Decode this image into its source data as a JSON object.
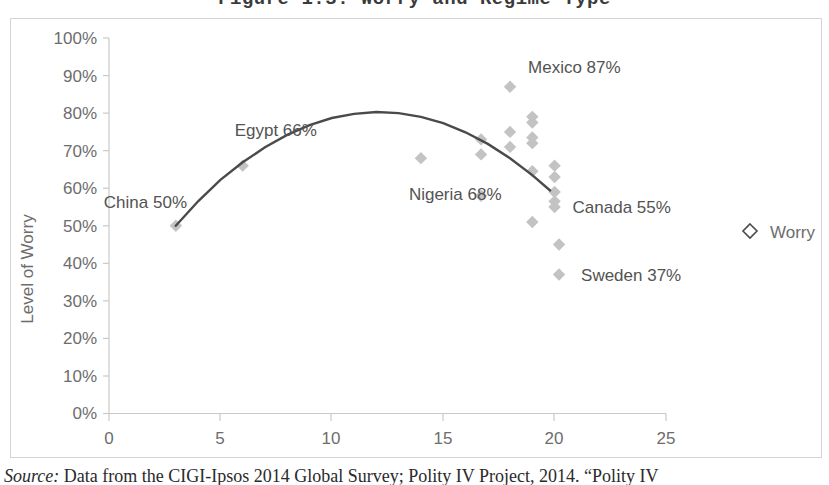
{
  "figure": {
    "title": "Figure 1.3: Worry and Regime Type",
    "source_label": "Source:",
    "source_text": " Data from the CIGI-Ipsos 2014 Global Survey; Polity IV Project, 2014. “Polity IV"
  },
  "colors": {
    "marker": "#c3c3c3",
    "trend_line": "#4a4a4a",
    "axis": "#c9c9c9",
    "tick_text": "#6d6d6d",
    "label_text": "#535353",
    "frame_border": "#d5d5d5",
    "background": "#ffffff"
  },
  "legend": {
    "position": "right",
    "entries": [
      {
        "label": "Worry",
        "marker": "open-diamond"
      }
    ]
  },
  "chart_data": {
    "type": "scatter",
    "title": "Figure 1.3: Worry and Regime Type",
    "xlabel": "",
    "ylabel": "Level of Worry",
    "xlim": [
      0,
      25
    ],
    "ylim": [
      0,
      1.0
    ],
    "grid": false,
    "legend": [
      "Worry"
    ],
    "legend_position": "right",
    "x_ticks": [
      0,
      5,
      10,
      15,
      20,
      25
    ],
    "x_tick_labels": [
      "0",
      "5",
      "10",
      "15",
      "20",
      "25"
    ],
    "y_ticks": [
      0,
      0.1,
      0.2,
      0.3,
      0.4,
      0.5,
      0.6,
      0.7,
      0.8,
      0.9,
      1.0
    ],
    "y_tick_labels": [
      "0%",
      "10%",
      "20%",
      "30%",
      "40%",
      "50%",
      "60%",
      "70%",
      "80%",
      "90%",
      "100%"
    ],
    "series": [
      {
        "name": "Worry",
        "marker": "diamond",
        "points": [
          {
            "x": 3,
            "y": 0.5
          },
          {
            "x": 6,
            "y": 0.66
          },
          {
            "x": 14,
            "y": 0.68
          },
          {
            "x": 16.7,
            "y": 0.73
          },
          {
            "x": 16.7,
            "y": 0.69
          },
          {
            "x": 16.7,
            "y": 0.58
          },
          {
            "x": 18,
            "y": 0.87
          },
          {
            "x": 18,
            "y": 0.75
          },
          {
            "x": 18,
            "y": 0.71
          },
          {
            "x": 19,
            "y": 0.79
          },
          {
            "x": 19,
            "y": 0.775
          },
          {
            "x": 19,
            "y": 0.735
          },
          {
            "x": 19,
            "y": 0.72
          },
          {
            "x": 19,
            "y": 0.645
          },
          {
            "x": 19,
            "y": 0.51
          },
          {
            "x": 20,
            "y": 0.66
          },
          {
            "x": 20,
            "y": 0.63
          },
          {
            "x": 20,
            "y": 0.59
          },
          {
            "x": 20,
            "y": 0.565
          },
          {
            "x": 20,
            "y": 0.55
          },
          {
            "x": 20.2,
            "y": 0.45
          },
          {
            "x": 20.2,
            "y": 0.37
          }
        ]
      }
    ],
    "trend": {
      "type": "quadratic-fit",
      "description": "Inverted-U polynomial trend line peaking near x=12 at about 80%",
      "points": [
        {
          "x": 3,
          "y": 0.5
        },
        {
          "x": 4,
          "y": 0.565
        },
        {
          "x": 5,
          "y": 0.622
        },
        {
          "x": 6,
          "y": 0.669
        },
        {
          "x": 7,
          "y": 0.709
        },
        {
          "x": 8,
          "y": 0.742
        },
        {
          "x": 9,
          "y": 0.768
        },
        {
          "x": 10,
          "y": 0.787
        },
        {
          "x": 11,
          "y": 0.798
        },
        {
          "x": 12,
          "y": 0.803
        },
        {
          "x": 13,
          "y": 0.8
        },
        {
          "x": 14,
          "y": 0.79
        },
        {
          "x": 15,
          "y": 0.773
        },
        {
          "x": 16,
          "y": 0.749
        },
        {
          "x": 17,
          "y": 0.718
        },
        {
          "x": 18,
          "y": 0.68
        },
        {
          "x": 19,
          "y": 0.635
        },
        {
          "x": 19.8,
          "y": 0.594
        }
      ]
    },
    "annotations": [
      {
        "text": "China 50%",
        "x": 3,
        "y": 0.5,
        "anchor": "above-right"
      },
      {
        "text": "Egypt 66%",
        "x": 6,
        "y": 0.66,
        "anchor": "above-right"
      },
      {
        "text": "Nigeria 68%",
        "x": 14,
        "y": 0.68,
        "anchor": "below-right"
      },
      {
        "text": "Mexico 87%",
        "x": 18,
        "y": 0.87,
        "anchor": "above-right"
      },
      {
        "text": "Canada 55%",
        "x": 20,
        "y": 0.55,
        "anchor": "right"
      },
      {
        "text": "Sweden 37%",
        "x": 20.2,
        "y": 0.37,
        "anchor": "right"
      }
    ]
  }
}
